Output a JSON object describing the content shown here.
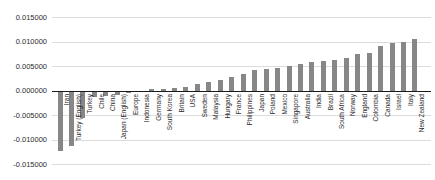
{
  "chart_data": {
    "type": "bar",
    "title": "",
    "xlabel": "",
    "ylabel": "",
    "legend": "none",
    "grid": "horizontal",
    "ylim": [
      -0.015,
      0.015
    ],
    "ytick_labels": [
      "0.015000",
      "0.010000",
      "0.005000",
      "0.000000",
      "-0.005000",
      "-0.010000",
      "-0.015000"
    ],
    "ytick_values": [
      0.015,
      0.01,
      0.005,
      0,
      -0.005,
      -0.01,
      -0.015
    ],
    "categories": [
      "Iran",
      "Turkey (English)",
      "Turkey",
      "Chile",
      "China",
      "Japan (English)",
      "Europe",
      "Indonesia",
      "Germany",
      "South Korea",
      "Britain",
      "USA",
      "Sweden",
      "Malaysia",
      "Hungary",
      "France",
      "Philippines",
      "Japan",
      "Poland",
      "Mexico",
      "Singapore",
      "Australia",
      "India",
      "Brazil",
      "South Africa",
      "Norway",
      "England",
      "Colombia",
      "Canada",
      "Israel",
      "Italy",
      "New Zealand"
    ],
    "values": [
      -0.0123,
      -0.0113,
      -0.0055,
      -0.0012,
      -0.001,
      -0.0008,
      -0.0005,
      -0.0002,
      0.0004,
      0.0005,
      0.0007,
      0.0009,
      0.0014,
      0.0018,
      0.0022,
      0.0029,
      0.0034,
      0.0042,
      0.0045,
      0.0047,
      0.0052,
      0.0055,
      0.0059,
      0.0062,
      0.0063,
      0.0068,
      0.0076,
      0.0078,
      0.0092,
      0.0098,
      0.01,
      0.0107
    ],
    "colors": {
      "bar": "#878787",
      "gridline": "#dcdcdc",
      "axis_line": "#1a1a1a",
      "text": "#2b2b2b",
      "background": "#ffffff"
    }
  }
}
